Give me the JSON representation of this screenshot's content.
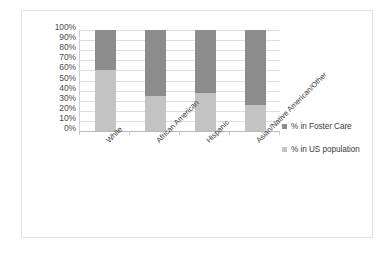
{
  "chart_data": {
    "type": "bar",
    "subtype": "stacked-100-percent",
    "title": "",
    "xlabel": "",
    "ylabel": "",
    "ylim": [
      0,
      100
    ],
    "grid": true,
    "legend_position": "right",
    "categories": [
      "White",
      "African American",
      "Hispanic",
      "Asian/Native American/Other"
    ],
    "ytick_labels": [
      "100%",
      "90%",
      "80%",
      "70%",
      "60%",
      "50%",
      "40%",
      "30%",
      "20%",
      "10%",
      "0%"
    ],
    "ytick_values": [
      100,
      90,
      80,
      70,
      60,
      50,
      40,
      30,
      20,
      10,
      0
    ],
    "series": [
      {
        "name": "% in Foster Care",
        "color": "#8c8c8c",
        "values": [
          40,
          65,
          62,
          74
        ]
      },
      {
        "name": "% in US population",
        "color": "#c3c3c3",
        "values": [
          60,
          35,
          38,
          26
        ]
      }
    ]
  },
  "legend": {
    "entries": [
      {
        "label": "% in Foster Care",
        "color": "#8c8c8c"
      },
      {
        "label": "% in US population",
        "color": "#c3c3c3"
      }
    ]
  },
  "colors": {
    "foster_care": "#8c8c8c",
    "us_population": "#c3c3c3",
    "gridline": "#dedede",
    "frame_border": "#e2e2e2",
    "axis_text": "#4b4b4b"
  }
}
